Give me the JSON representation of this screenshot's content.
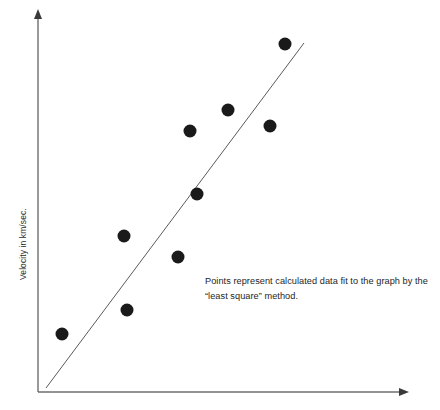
{
  "figure": {
    "name": "velocity-least-squares-scatter",
    "background_color": "#ffffff"
  },
  "axes": {
    "y_label": "Velocity in km/sec.",
    "x_label": "",
    "axis_color": "#6e6e6e",
    "origin_px": [
      38,
      392
    ],
    "y_axis_top_px": [
      38,
      12
    ],
    "x_axis_right_px": [
      406,
      392
    ],
    "arrowheads": [
      "y-axis-top",
      "x-axis-right"
    ]
  },
  "annotation": {
    "line1": "Points represent calculated data fit to the graph by the",
    "line2": "“least square” method.",
    "color": "#1e1e1e"
  },
  "chart_data": {
    "type": "scatter",
    "title": "",
    "xlabel": "",
    "ylabel": "Velocity in km/sec.",
    "grid": false,
    "legend": null,
    "xlim": [
      0,
      10
    ],
    "ylim": [
      0,
      10
    ],
    "marker_color": "#1a1a1a",
    "marker_radius_px": 6.5,
    "points_px": [
      [
        62,
        334
      ],
      [
        127,
        310
      ],
      [
        124,
        236
      ],
      [
        178,
        257
      ],
      [
        197,
        194
      ],
      [
        190,
        131
      ],
      [
        228,
        110
      ],
      [
        270,
        126
      ],
      [
        285,
        44
      ]
    ],
    "x": [
      0.65,
      2.4,
      2.3,
      3.8,
      4.3,
      4.1,
      5.2,
      6.3,
      6.7
    ],
    "y": [
      1.5,
      2.2,
      4.2,
      3.6,
      5.3,
      6.9,
      7.5,
      7.0,
      9.2
    ],
    "fit_line": {
      "label": "least square fit",
      "color": "#5a5a5a",
      "width_px": 1,
      "start_px": [
        46,
        388
      ],
      "end_px": [
        304,
        43
      ]
    }
  }
}
